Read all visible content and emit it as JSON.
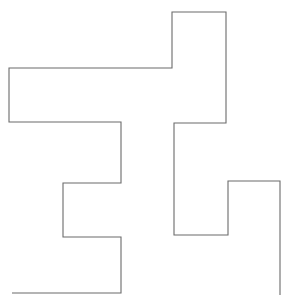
{
  "figure": {
    "title": "",
    "type": "line-drawing",
    "canvas": {
      "width": 294,
      "height": 304,
      "background_color": "#ffffff"
    },
    "stroke": {
      "color": "#6b6b6b",
      "width": 1.1,
      "linejoin": "miter",
      "linecap": "butt",
      "fill": "none"
    },
    "path": {
      "closed": false,
      "segment_count": 18,
      "vertex_count": 19,
      "points": [
        [
          12,
          293
        ],
        [
          121,
          293
        ],
        [
          121,
          237
        ],
        [
          63,
          237
        ],
        [
          63,
          183
        ],
        [
          121,
          183
        ],
        [
          121,
          122
        ],
        [
          9,
          122
        ],
        [
          9,
          68
        ],
        [
          172,
          68
        ],
        [
          172,
          12
        ],
        [
          226,
          12
        ],
        [
          226,
          123
        ],
        [
          174,
          123
        ],
        [
          174,
          235
        ],
        [
          228,
          235
        ],
        [
          228,
          181
        ],
        [
          280,
          181
        ],
        [
          280,
          295
        ]
      ]
    }
  }
}
